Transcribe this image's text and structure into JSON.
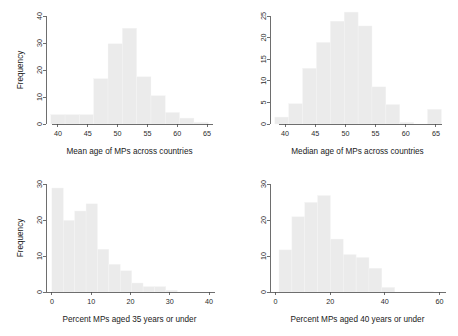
{
  "figure": {
    "title": "",
    "panel_count": 4,
    "background_color": "#ffffff",
    "bar_color": "#ebebeb",
    "axis_color": "#4a4a4a"
  },
  "panels": [
    {
      "id": "mean-age",
      "position": "top-left",
      "ylabel": "Frequency",
      "xlabel": "Mean age of MPs across countries"
    },
    {
      "id": "median-age",
      "position": "top-right",
      "ylabel": "",
      "xlabel": "Median age of MPs across countries"
    },
    {
      "id": "pct-35-under",
      "position": "bottom-left",
      "ylabel": "Frequency",
      "xlabel": "Percent MPs aged 35 years or under"
    },
    {
      "id": "pct-40-under",
      "position": "bottom-right",
      "ylabel": "",
      "xlabel": "Percent MPs aged 40 years or under"
    }
  ],
  "chart_data": [
    {
      "type": "bar",
      "id": "mean-age",
      "title": "",
      "xlabel": "Mean age of MPs across countries",
      "ylabel": "Frequency",
      "xlim": [
        38.0,
        66.0
      ],
      "ylim": [
        0,
        40
      ],
      "xticks": [
        40,
        45,
        50,
        55,
        60,
        65
      ],
      "yticks": [
        0,
        10,
        20,
        30,
        40
      ],
      "grid": false,
      "legend": false,
      "bin_width": 2.4,
      "bin_edges": [
        38.8,
        41.2,
        43.6,
        46.0,
        48.4,
        50.8,
        53.2,
        55.6,
        58.0,
        60.4,
        62.8,
        65.2
      ],
      "bin_centers": [
        40.0,
        42.4,
        44.8,
        47.2,
        49.6,
        52.0,
        54.4,
        56.8,
        59.2,
        61.6,
        64.0
      ],
      "values": [
        3.5,
        3.5,
        3.5,
        16.8,
        29.7,
        35.5,
        17.5,
        10.5,
        4.3,
        2.2,
        0.6
      ]
    },
    {
      "type": "bar",
      "id": "median-age",
      "title": "",
      "xlabel": "Median age of MPs across countries",
      "ylabel": "",
      "xlim": [
        37.5,
        66.5
      ],
      "ylim": [
        0,
        25
      ],
      "xticks": [
        40,
        45,
        50,
        55,
        60,
        65
      ],
      "yticks": [
        0,
        5,
        10,
        15,
        20,
        25
      ],
      "grid": false,
      "legend": false,
      "bin_width": 2.3,
      "bin_edges": [
        38.3,
        40.6,
        42.9,
        45.2,
        47.5,
        49.8,
        52.1,
        54.4,
        56.7,
        59.0,
        61.3,
        63.6,
        65.9
      ],
      "bin_centers": [
        39.45,
        41.75,
        44.05,
        46.35,
        48.65,
        50.95,
        53.25,
        55.55,
        57.85,
        60.15,
        62.45,
        64.75
      ],
      "values": [
        1.6,
        4.7,
        12.9,
        18.9,
        23.8,
        25.9,
        22.7,
        8.6,
        4.5,
        0.4,
        0.0,
        3.4
      ]
    },
    {
      "type": "bar",
      "id": "pct-35-under",
      "title": "",
      "xlabel": "Percent MPs aged 35 years or under",
      "ylabel": "Frequency",
      "xlim": [
        -1.5,
        41.0
      ],
      "ylim": [
        0,
        30
      ],
      "xticks": [
        0,
        10,
        20,
        30,
        40
      ],
      "yticks": [
        0,
        10,
        20,
        30
      ],
      "grid": false,
      "legend": false,
      "bin_width": 2.9,
      "bin_edges": [
        0.0,
        2.9,
        5.8,
        8.7,
        11.6,
        14.5,
        17.4,
        20.3,
        23.2,
        26.1,
        29.0,
        31.9,
        34.8
      ],
      "bin_centers": [
        1.45,
        4.35,
        7.25,
        10.15,
        13.05,
        15.95,
        18.85,
        21.75,
        24.65,
        27.55,
        30.45,
        33.35
      ],
      "values": [
        28.9,
        19.9,
        22.5,
        24.5,
        11.9,
        7.7,
        5.9,
        2.5,
        1.5,
        1.5,
        0.5,
        0.0
      ]
    },
    {
      "type": "bar",
      "id": "pct-40-under",
      "title": "",
      "xlabel": "Percent MPs aged 40 years or under",
      "ylabel": "",
      "xlim": [
        -2.0,
        62.0
      ],
      "ylim": [
        0,
        30
      ],
      "xticks": [
        0,
        20,
        40,
        60
      ],
      "yticks": [
        0,
        10,
        20,
        30
      ],
      "grid": false,
      "legend": false,
      "bin_width": 4.7,
      "bin_edges": [
        1.3,
        6.0,
        10.7,
        15.4,
        20.1,
        24.8,
        29.5,
        34.2,
        38.9,
        43.6,
        48.3,
        53.0,
        57.7
      ],
      "bin_centers": [
        3.65,
        8.35,
        13.05,
        17.75,
        22.45,
        27.15,
        31.85,
        36.55,
        41.25,
        45.95,
        50.65,
        55.35
      ],
      "values": [
        11.7,
        20.9,
        24.9,
        26.8,
        14.7,
        10.4,
        9.6,
        6.6,
        1.3,
        0.0,
        0.0,
        0.2
      ]
    }
  ]
}
